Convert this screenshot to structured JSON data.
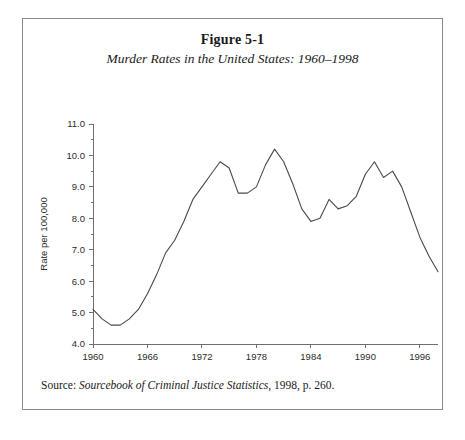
{
  "figure": {
    "title": "Figure 5-1",
    "subtitle": "Murder Rates in the United States: 1960–1998",
    "source": {
      "label": "Source: ",
      "publication": "Sourcebook of Criminal Justice Statistics",
      "tail": ", 1998, p. 260."
    }
  },
  "chart_data": {
    "type": "line",
    "title": "Murder Rates in the United States: 1960–1998",
    "xlabel": "Year of Murder",
    "ylabel": "Rate per 100,000",
    "xlim": [
      1960,
      1998
    ],
    "ylim": [
      4.0,
      11.0
    ],
    "grid": false,
    "legend": "none",
    "xticks": [
      1960,
      1966,
      1972,
      1978,
      1984,
      1990,
      1996
    ],
    "xtick_labels": [
      "1960",
      "1966",
      "1972",
      "1978",
      "1984",
      "1990",
      "1996"
    ],
    "yticks": [
      4.0,
      5.0,
      6.0,
      7.0,
      8.0,
      9.0,
      10.0,
      11.0
    ],
    "ytick_labels": [
      "4.0",
      "5.0",
      "6.0",
      "7.0",
      "8.0",
      "9.0",
      "10.0",
      "11.0"
    ],
    "x": [
      1960,
      1961,
      1962,
      1963,
      1964,
      1965,
      1966,
      1967,
      1968,
      1969,
      1970,
      1971,
      1972,
      1973,
      1974,
      1975,
      1976,
      1977,
      1978,
      1979,
      1980,
      1981,
      1982,
      1983,
      1984,
      1985,
      1986,
      1987,
      1988,
      1989,
      1990,
      1991,
      1992,
      1993,
      1994,
      1995,
      1996,
      1997,
      1998
    ],
    "values": [
      5.1,
      4.8,
      4.6,
      4.6,
      4.8,
      5.1,
      5.6,
      6.2,
      6.9,
      7.3,
      7.9,
      8.6,
      9.0,
      9.4,
      9.8,
      9.6,
      8.8,
      8.8,
      9.0,
      9.7,
      10.2,
      9.8,
      9.1,
      8.3,
      7.9,
      8.0,
      8.6,
      8.3,
      8.4,
      8.7,
      9.4,
      9.8,
      9.3,
      9.5,
      9.0,
      8.2,
      7.4,
      6.8,
      6.3
    ],
    "series": [
      {
        "name": "Murder rate per 100,000",
        "values": [
          5.1,
          4.8,
          4.6,
          4.6,
          4.8,
          5.1,
          5.6,
          6.2,
          6.9,
          7.3,
          7.9,
          8.6,
          9.0,
          9.4,
          9.8,
          9.6,
          8.8,
          8.8,
          9.0,
          9.7,
          10.2,
          9.8,
          9.1,
          8.3,
          7.9,
          8.0,
          8.6,
          8.3,
          8.4,
          8.7,
          9.4,
          9.8,
          9.3,
          9.5,
          9.0,
          8.2,
          7.4,
          6.8,
          6.3
        ]
      }
    ],
    "annotations": []
  }
}
